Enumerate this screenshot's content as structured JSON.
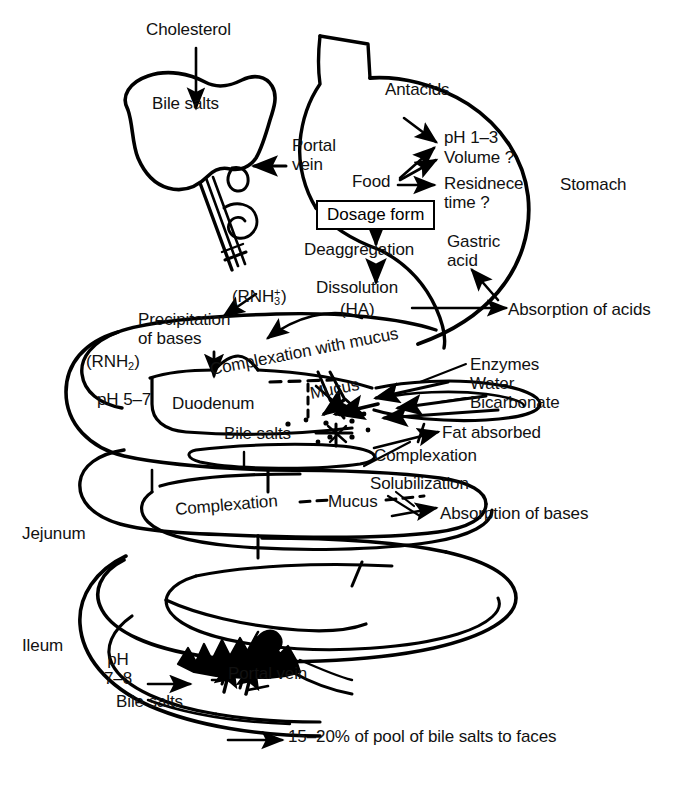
{
  "figure": {
    "type": "diagram",
    "background": "#ffffff",
    "line_color": "#000000",
    "width": 676,
    "height": 786
  },
  "organs": {
    "liver_label": "Bile salts",
    "stomach_label": "Stomach",
    "duodenum_label": "Duodenum",
    "jejunum_label": "Jejunum",
    "ileum_label": "Ileum",
    "portal_vein_upper": "Portal\nvein",
    "portal_vein_lower": "Portal vein"
  },
  "inputs": {
    "cholesterol": "Cholesterol",
    "antacids": "Antacids",
    "food": "Food"
  },
  "stomach_factors": {
    "ph": "pH 1–3",
    "volume": "Volume ?",
    "residence_time": "Residnece\ntime ?",
    "gastric_acid": "Gastric\nacid"
  },
  "drug_pathway": {
    "dosage_form": "Dosage form",
    "deaggregation": "Deaggregation",
    "dissolution": "Dissolution",
    "ha_species": "(HA)",
    "rnh3_species": "(RNH₃⁺)",
    "rnh2_species": "(RNH₂)",
    "precipitation_of_bases": "Precipitation\nof bases"
  },
  "absorption": {
    "acids": "Absorption of acids",
    "bases": "Absorption of bases",
    "fat": "Fat absorbed"
  },
  "duodenum_region": {
    "complexation_with_mucus": "Complexation with mucus",
    "mucus": "Mucus",
    "ph": "pH 5–7",
    "bile_salts": "Bile salts",
    "complexation": "Complexation",
    "solubilization": "Solubilization"
  },
  "pancreatic_secretions": {
    "enzymes": "Enzymes",
    "water": "Water",
    "bicarbonate": "Bicarbonate"
  },
  "jejunum_region": {
    "complexation": "Complexation",
    "mucus": "Mucus"
  },
  "ileum_region": {
    "ph": "pH\n7–8",
    "bile_salts": "Bile salts",
    "excretion": "15–20% of pool of bile salts to faces"
  }
}
